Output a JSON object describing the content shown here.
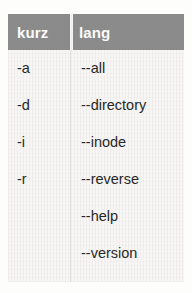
{
  "table": {
    "columns": [
      {
        "key": "kurz",
        "label": "kurz"
      },
      {
        "key": "lang",
        "label": "lang"
      }
    ],
    "rows": [
      {
        "kurz": "-a",
        "lang": "--all"
      },
      {
        "kurz": "-d",
        "lang": "--directory"
      },
      {
        "kurz": "-i",
        "lang": "--inode"
      },
      {
        "kurz": "-r",
        "lang": "--reverse"
      },
      {
        "kurz": "",
        "lang": "--help"
      },
      {
        "kurz": "",
        "lang": "--version"
      }
    ]
  },
  "colors": {
    "header_background": "#8b8b8b",
    "header_text": "#ffffff",
    "body_background": "#f7f6f4",
    "body_text": "#262626",
    "column_divider": "#e2e0dc"
  }
}
